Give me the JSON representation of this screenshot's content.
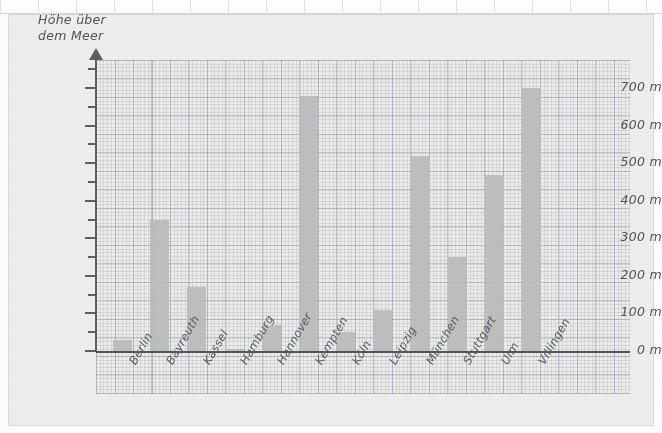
{
  "chart_data": {
    "type": "bar",
    "title": "",
    "ylabel": "Höhe über\ndem Meer",
    "xlabel": "",
    "ylim": [
      0,
      760
    ],
    "ytick_step": 100,
    "yminor_step": 50,
    "grid": true,
    "legend": null,
    "unit": "m",
    "categories": [
      "Berlin",
      "Bayreuth",
      "Kassel",
      "Hamburg",
      "Hannover",
      "Kempten",
      "Köln",
      "Leipzig",
      "München",
      "Stuttgart",
      "Ulm",
      "Villingen"
    ],
    "values": [
      30,
      350,
      170,
      5,
      70,
      680,
      50,
      110,
      520,
      250,
      470,
      700
    ],
    "ytick_labels": [
      "0 m",
      "100 m",
      "200 m",
      "300 m",
      "400 m",
      "500 m",
      "600 m",
      "700 m"
    ],
    "ytick_values": [
      0,
      100,
      200,
      300,
      400,
      500,
      600,
      700
    ],
    "bar_color": "#b9bcbb",
    "axis_color": "#5c6066",
    "paper_color": "#ececea",
    "grid_color": "#8c98a5"
  }
}
